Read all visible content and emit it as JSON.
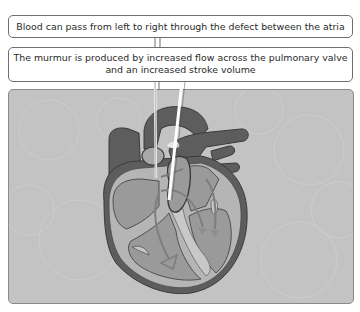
{
  "callouts": [
    {
      "id": "atrial-defect",
      "text": "Blood can pass from left to right through the defect between the atria"
    },
    {
      "id": "murmur",
      "line1": "The murmur is produced by increased flow across the pulmonary valve",
      "line2": "and an increased stroke volume"
    }
  ],
  "illustration": {
    "subject": "heart-cross-section",
    "colors": {
      "panel_background": "#c4c4c4",
      "vessel_dark": "#5d5d5d",
      "chamber_mid": "#9a9a9a",
      "wall_light": "#b5b5b5",
      "outline": "#3a3a3a",
      "leader_line": "#ffffff"
    }
  }
}
